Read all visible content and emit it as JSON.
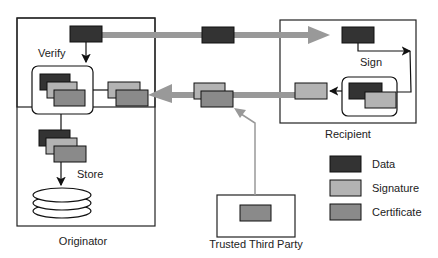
{
  "labels": {
    "verify": "Verify",
    "sign": "Sign",
    "store": "Store",
    "originator": "Originator",
    "recipient": "Recipient",
    "trusted_third_party": "Trusted Third Party"
  },
  "legend": [
    {
      "label": "Data",
      "color": "#333333"
    },
    {
      "label": "Signature",
      "color": "#b3b3b3"
    },
    {
      "label": "Certificate",
      "color": "#8a8a8a"
    }
  ],
  "colors": {
    "data": "#333333",
    "signature": "#b3b3b3",
    "certificate": "#8a8a8a",
    "flow_arrow": "#999999"
  }
}
